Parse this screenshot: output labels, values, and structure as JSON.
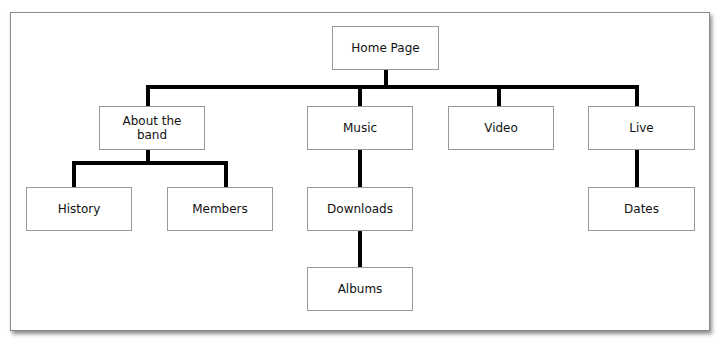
{
  "diagram": {
    "type": "site-map",
    "root": {
      "id": "home",
      "label": "Home Page"
    },
    "nodes": {
      "home": "Home Page",
      "about": "About the band",
      "music": "Music",
      "video": "Video",
      "live": "Live",
      "history": "History",
      "members": "Members",
      "downloads": "Downloads",
      "dates": "Dates",
      "albums": "Albums"
    },
    "edges": [
      [
        "home",
        "about"
      ],
      [
        "home",
        "music"
      ],
      [
        "home",
        "video"
      ],
      [
        "home",
        "live"
      ],
      [
        "about",
        "history"
      ],
      [
        "about",
        "members"
      ],
      [
        "music",
        "downloads"
      ],
      [
        "downloads",
        "albums"
      ],
      [
        "live",
        "dates"
      ]
    ]
  }
}
